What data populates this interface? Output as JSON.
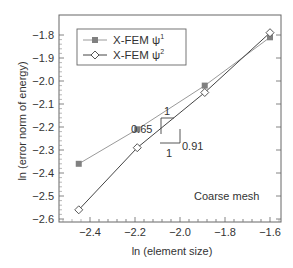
{
  "chart_data": {
    "type": "line",
    "title": "",
    "xlabel": "ln (element size)",
    "ylabel": "ln (error norm of energy)",
    "xlim": [
      -2.52,
      -1.54
    ],
    "ylim": [
      -2.62,
      -1.72
    ],
    "xticks": [
      -2.4,
      -2.2,
      -2.0,
      -1.8,
      -1.6
    ],
    "xtick_labels": [
      "−2.4",
      "−2.2",
      "−2.0",
      "−1.8",
      "−1.6"
    ],
    "yticks": [
      -1.8,
      -1.9,
      -2.0,
      -2.1,
      -2.2,
      -2.3,
      -2.4,
      -2.5,
      -2.6
    ],
    "ytick_labels": [
      "−1.8",
      "−1.9",
      "−2.0",
      "−2.1",
      "−2.2",
      "−2.3",
      "−2.4",
      "−2.5",
      "−2.6"
    ],
    "grid": false,
    "legend_position": "upper left",
    "series": [
      {
        "name": "X-FEM ψ¹",
        "marker": "filled-square",
        "color": "#888888",
        "x": [
          -2.45,
          -2.19,
          -1.89,
          -1.6
        ],
        "y": [
          -2.36,
          -2.21,
          -2.02,
          -1.81
        ]
      },
      {
        "name": "X-FEM ψ²",
        "marker": "open-diamond",
        "color": "#444444",
        "x": [
          -2.45,
          -2.19,
          -1.89,
          -1.6
        ],
        "y": [
          -2.56,
          -2.29,
          -2.05,
          -1.79
        ]
      }
    ],
    "annotations": [
      {
        "type": "slope-triangle",
        "series": "X-FEM ψ¹",
        "rise_label": "0.65",
        "run_label": "1"
      },
      {
        "type": "slope-triangle",
        "series": "X-FEM ψ²",
        "rise_label": "0.91",
        "run_label": "1"
      },
      {
        "type": "text",
        "label": "Coarse mesh"
      }
    ]
  },
  "legend": {
    "items": [
      {
        "label": "X-FEM ψ",
        "sup": "1"
      },
      {
        "label": "X-FEM ψ",
        "sup": "2"
      }
    ]
  },
  "annotations": {
    "slope1_rise": "0.65",
    "slope1_run": "1",
    "slope2_rise": "0.91",
    "slope2_run": "1",
    "mesh_label": "Coarse mesh"
  },
  "axes": {
    "xlabel": "ln (element size)",
    "ylabel": "ln (error norm of energy)"
  }
}
